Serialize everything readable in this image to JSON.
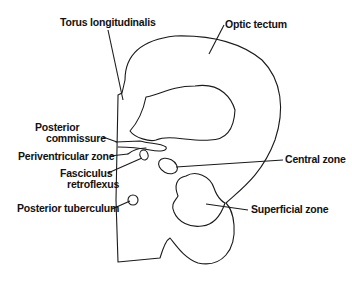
{
  "diagram": {
    "labels": {
      "torus_longitudinalis": "Torus longitudinalis",
      "optic_tectum": "Optic tectum",
      "posterior_commissure_1": "Posterior",
      "posterior_commissure_2": "commissure",
      "periventricular_zone": "Periventricular zone",
      "fasciculus_retroflexus_1": "Fasciculus",
      "fasciculus_retroflexus_2": "retroflexus",
      "central_zone": "Central zone",
      "posterior_tuberculum": "Posterior tuberculum",
      "superficial_zone": "Superficial zone"
    },
    "colors": {
      "stroke": "#1a1a1a",
      "text": "#111111",
      "background": "#ffffff"
    }
  }
}
